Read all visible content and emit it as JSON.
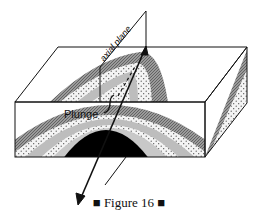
{
  "figure": {
    "labels": {
      "axial_plane": "axial plane",
      "plunge": "Plunge"
    },
    "caption": {
      "left_marker": "■",
      "text": "Figure 16",
      "right_marker": "■"
    },
    "colors": {
      "outline": "#111111",
      "dark_layer": "#7a7a7a",
      "light_layer": "#bdbdbd",
      "core": "#000000",
      "dotted_fill": "#f2f2f2",
      "background": "#ffffff"
    }
  }
}
